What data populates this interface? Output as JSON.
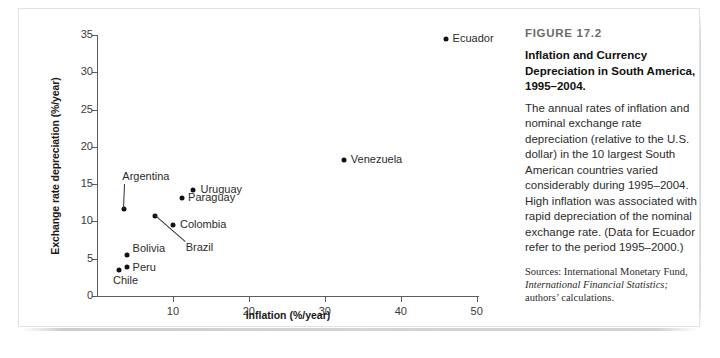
{
  "figure": {
    "number_label": "FIGURE 17.2",
    "title": "Inflation and Currency Depreciation in South America, 1995–2004.",
    "body": "The annual rates of inflation and nominal exchange rate depreciation (relative to the U.S. dollar) in the 10 largest South American countries varied considerably during 1995–2004. High inflation was associated with rapid depreciation of the nominal exchange rate. (Data for Ecuador refer to the period 1995–2000.)",
    "sources_prefix": "Sources: International Monetary Fund, ",
    "sources_italic": "International Financial Statistics;",
    "sources_suffix": " authors’ calculations."
  },
  "chart_data": {
    "type": "scatter",
    "title": "Inflation and Currency Depreciation in South America, 1995–2004.",
    "xlabel": "Inflation (%/year)",
    "ylabel": "Exchange rate depreciation (%/year)",
    "xlim": [
      0,
      50.3
    ],
    "ylim": [
      0,
      35
    ],
    "xticks": [
      10,
      20,
      30,
      40,
      50
    ],
    "yticks": [
      0,
      5,
      10,
      15,
      20,
      25,
      30,
      35
    ],
    "xtick_labels": [
      "10",
      "20",
      "30",
      "40",
      "50"
    ],
    "ytick_labels": [
      "0",
      "5",
      "10",
      "15",
      "20",
      "25",
      "30",
      "35"
    ],
    "grid": false,
    "legend": "none",
    "points": [
      {
        "name": "Ecuador",
        "x": 45.9,
        "y": 34.5,
        "label_side": "right",
        "leader": false
      },
      {
        "name": "Venezuela",
        "x": 32.5,
        "y": 18.3,
        "label_side": "right",
        "leader": false
      },
      {
        "name": "Uruguay",
        "x": 12.7,
        "y": 14.2,
        "label_side": "right",
        "leader": false
      },
      {
        "name": "Paraguay",
        "x": 11.2,
        "y": 13.1,
        "label_side": "right",
        "leader": false
      },
      {
        "name": "Argentina",
        "x": 3.6,
        "y": 11.6,
        "label_side": "above",
        "leader": true
      },
      {
        "name": "Brazil",
        "x": 7.6,
        "y": 10.7,
        "label_side": "below-right",
        "leader": true
      },
      {
        "name": "Colombia",
        "x": 10.0,
        "y": 9.5,
        "label_side": "right",
        "leader": false
      },
      {
        "name": "Bolivia",
        "x": 3.9,
        "y": 5.5,
        "label_side": "right",
        "leader": false
      },
      {
        "name": "Peru",
        "x": 3.9,
        "y": 3.9,
        "label_side": "right",
        "leader": false
      },
      {
        "name": "Chile",
        "x": 2.9,
        "y": 3.5,
        "label_side": "below",
        "leader": false
      }
    ]
  }
}
